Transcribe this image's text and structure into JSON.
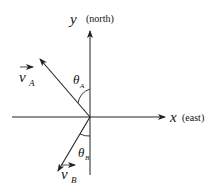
{
  "diagram": {
    "axes": {
      "y": {
        "label": "y",
        "annotation": "(north)"
      },
      "x": {
        "label": "x",
        "annotation": "(east)"
      }
    },
    "vectors": [
      {
        "name": "v_A",
        "symbol": "v",
        "subscript": "A",
        "direction": "north-west"
      },
      {
        "name": "v_B",
        "symbol": "v",
        "subscript": "B",
        "direction": "south-west"
      }
    ],
    "angles": [
      {
        "symbol": "θ",
        "subscript": "A",
        "between": "v_A and +y axis"
      },
      {
        "symbol": "θ",
        "subscript": "B",
        "between": "v_B and -y axis"
      }
    ],
    "colors": {
      "stroke": "#222222",
      "background": "#ffffff"
    }
  }
}
